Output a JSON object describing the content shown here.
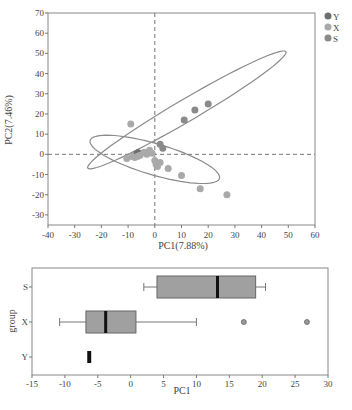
{
  "chart_data": [
    {
      "type": "scatter",
      "title": "",
      "xlabel": "PC1(7.88%)",
      "ylabel": "PC2(7.46%)",
      "xlim": [
        -40,
        60
      ],
      "ylim": [
        -35,
        70
      ],
      "xticks": [
        -40,
        -30,
        -20,
        -10,
        0,
        10,
        20,
        30,
        40,
        50,
        60
      ],
      "yticks": [
        -30,
        -20,
        -10,
        0,
        10,
        20,
        30,
        40,
        50,
        60,
        70
      ],
      "grid": false,
      "reference_lines": {
        "x": 0,
        "y": 0,
        "style": "dashed"
      },
      "legend": {
        "position": "right-top",
        "entries": [
          {
            "label": "Y",
            "color": "#6e6e6e"
          },
          {
            "label": "X",
            "color": "#a9a9a9"
          },
          {
            "label": "S",
            "color": "#8a8a8a"
          }
        ]
      },
      "series": [
        {
          "name": "Y",
          "color": "#6e6e6e",
          "points": [
            [
              -6.5,
              0.5
            ],
            [
              -6.0,
              -0.5
            ],
            [
              -6.8,
              0.0
            ],
            [
              -6.2,
              0.8
            ]
          ]
        },
        {
          "name": "X",
          "color": "#a9a9a9",
          "points": [
            [
              -10.5,
              -2.0
            ],
            [
              -8.5,
              -1.0
            ],
            [
              -7.5,
              -1.5
            ],
            [
              -6.5,
              -1.0
            ],
            [
              -5.5,
              -0.5
            ],
            [
              -4.0,
              1.0
            ],
            [
              -3.0,
              0.0
            ],
            [
              -2.0,
              2.0
            ],
            [
              -1.0,
              0.5
            ],
            [
              0.0,
              -3.0
            ],
            [
              0.5,
              -5.0
            ],
            [
              1.0,
              -6.0
            ],
            [
              2.0,
              -4.0
            ],
            [
              1.0,
              -4.5
            ],
            [
              5.0,
              -7.0
            ],
            [
              10.0,
              -10.5
            ],
            [
              17.0,
              -17.0
            ],
            [
              27.0,
              -20.0
            ],
            [
              -9.0,
              15.0
            ]
          ]
        },
        {
          "name": "S",
          "color": "#8a8a8a",
          "points": [
            [
              2.0,
              5.0
            ],
            [
              3.0,
              3.0
            ],
            [
              11.0,
              17.0
            ],
            [
              15.0,
              22.0
            ],
            [
              20.0,
              25.0
            ]
          ]
        }
      ],
      "ellipses": [
        {
          "group": "X",
          "cx": 0.0,
          "cy": -2.5,
          "rx": 26,
          "ry": 7.5,
          "angle_deg": -22
        },
        {
          "group": "S",
          "cx": 12.0,
          "cy": 22.0,
          "rx": 47,
          "ry": 5.0,
          "angle_deg": 38
        }
      ]
    },
    {
      "type": "box",
      "title": "",
      "xlabel": "PC1",
      "ylabel": "group",
      "xlim": [
        -15,
        30
      ],
      "xticks": [
        -15,
        -10,
        -5,
        0,
        5,
        10,
        15,
        20,
        25,
        30
      ],
      "categories": [
        "S",
        "X",
        "Y"
      ],
      "boxes": [
        {
          "group": "S",
          "whisker_low": 2.0,
          "q1": 4.0,
          "median": 13.2,
          "q3": 19.0,
          "whisker_high": 20.5,
          "outliers": []
        },
        {
          "group": "X",
          "whisker_low": -10.8,
          "q1": -6.8,
          "median": -3.8,
          "q3": 0.8,
          "whisker_high": 10.0,
          "outliers": [
            17.2,
            26.8
          ]
        },
        {
          "group": "Y",
          "whisker_low": -6.6,
          "q1": -6.6,
          "median": -6.3,
          "q3": -6.0,
          "whisker_high": -6.0,
          "outliers": []
        }
      ],
      "box_color": "#a0a0a0"
    }
  ],
  "labels": {
    "scatter_xlabel": "PC1(7.88%)",
    "scatter_ylabel": "PC2(7.46%)",
    "box_xlabel": "PC1",
    "box_ylabel": "group",
    "legend_y": "Y",
    "legend_x": "X",
    "legend_s": "S"
  }
}
